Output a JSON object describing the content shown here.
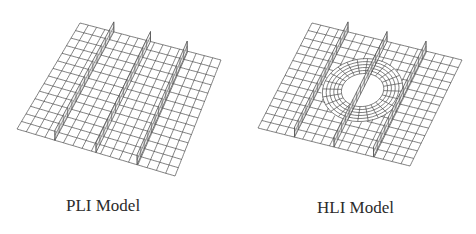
{
  "figure": {
    "panels": [
      {
        "id": "pli",
        "caption": "PLI Model",
        "mesh": {
          "corners": {
            "tl": [
              80,
              23
            ],
            "tr": [
              221,
              60
            ],
            "br": [
              175,
              176
            ],
            "bl": [
              17,
              129
            ]
          },
          "cols": 17,
          "rows": 14,
          "stiffeners_u": [
            0.24,
            0.5,
            0.76
          ],
          "stiffener_height": 10,
          "hole": null
        }
      },
      {
        "id": "hli",
        "caption": "HLI Model",
        "mesh": {
          "corners": {
            "tl": [
              74,
              23
            ],
            "tr": [
              224,
              60
            ],
            "br": [
              172,
              166
            ],
            "bl": [
              20,
              128
            ]
          },
          "cols": 17,
          "rows": 14,
          "stiffeners_u": [
            0.24,
            0.5,
            0.76
          ],
          "stiffener_height": 10,
          "hole": {
            "cu": 0.5,
            "cv": 0.46,
            "ru": 0.13,
            "rv": 0.15,
            "rings": 5,
            "spokes": 24
          }
        }
      }
    ],
    "colors": {
      "mesh": "#4a4a4a",
      "stiffener": "#555555",
      "background": "#ffffff"
    }
  }
}
